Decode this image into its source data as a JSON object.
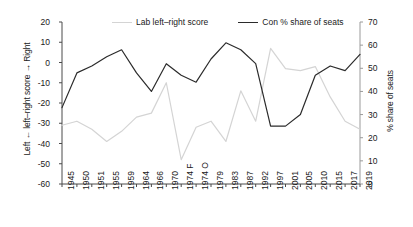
{
  "chart_data": {
    "type": "line",
    "title": "",
    "xlabel": "",
    "ylabel": "Left ← left–right score → Right",
    "y2label": "% share of seats",
    "ylim": [
      -60,
      20
    ],
    "y2lim": [
      0,
      70
    ],
    "yticks": [
      "20",
      "10",
      "0",
      "-10",
      "-20",
      "-30",
      "-40",
      "-50",
      "-60"
    ],
    "y2ticks": [
      "70",
      "60",
      "50",
      "40",
      "30",
      "20",
      "10",
      "0"
    ],
    "grid": false,
    "legend_position": "top-center",
    "categories": [
      "1945",
      "1950",
      "1951",
      "1955",
      "1959",
      "1964",
      "1966",
      "1970",
      "1974 F",
      "1974 O",
      "1979",
      "1983",
      "1987",
      "1992",
      "1997",
      "2001",
      "2005",
      "2010",
      "2015",
      "2017",
      "2019"
    ],
    "series": [
      {
        "name": "Lab left–right score",
        "axis": "left",
        "color": "#d4d4d4",
        "values": [
          -31,
          -29,
          -33,
          -39,
          -34,
          -27,
          -25,
          -10,
          -48,
          -32,
          -29,
          -39,
          -14,
          -29,
          7,
          -3,
          -4,
          -2,
          -17,
          -29,
          -33
        ]
      },
      {
        "name": "Con % share of seats",
        "axis": "right",
        "color": "#2b2b2b",
        "values": [
          33,
          48,
          51,
          55,
          58,
          48,
          40,
          52,
          47,
          44,
          54,
          61,
          58,
          52,
          25,
          25,
          30,
          47,
          51,
          49,
          56
        ]
      }
    ]
  },
  "legend": {
    "items": [
      {
        "label": "Lab left–right score"
      },
      {
        "label": "Con % share of seats"
      }
    ]
  }
}
